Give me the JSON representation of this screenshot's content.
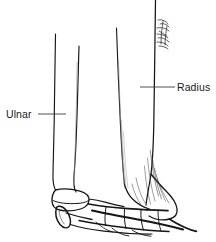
{
  "figure": {
    "kind": "anatomical-line-drawing",
    "background_color": "#ffffff",
    "ink_color": "#151515",
    "shading_color": "#6b6b6b",
    "width": 216,
    "height": 242
  },
  "labels": {
    "ulnar": {
      "text": "Ulnar",
      "leader_from_x": 38,
      "leader_to_x": 66,
      "leader_y": 114
    },
    "radius": {
      "text": "Radius",
      "leader_from_x": 140,
      "leader_to_x": 175,
      "leader_y": 87
    }
  },
  "annotations": {
    "handwritten_note": {
      "text": "",
      "description": "small illegible handwritten script marks beside upper radius shaft",
      "x": 155,
      "y": 18
    }
  },
  "structures": {
    "ulna_shaft": "ulna-shaft-outline",
    "ulna_head": "ulna-distal-head",
    "ulna_styloid": "ulna-styloid-process",
    "radius_shaft": "radius-shaft-outline",
    "radius_distal": "radius-distal-flare",
    "radius_styloid": "radius-styloid-process",
    "carpal_row": "proximal-carpal-row"
  }
}
